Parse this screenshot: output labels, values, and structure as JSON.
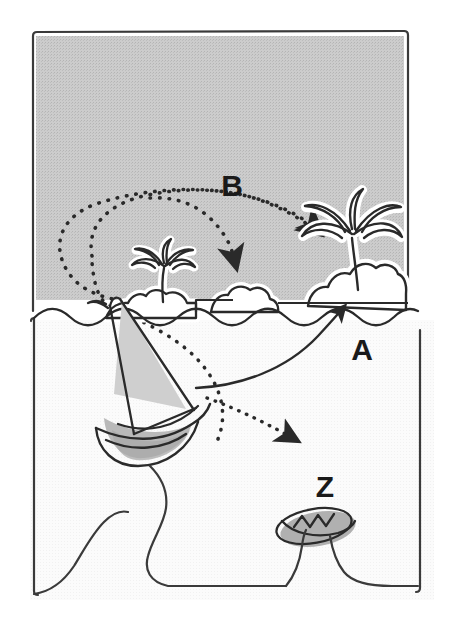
{
  "illustration": {
    "title": "Sailboat route to island diagram",
    "background_color": "#ffffff",
    "sky_color": "#c9c9c9",
    "sea_color": "#fafafa",
    "ink_color": "#2a2a2a",
    "shade_color": "#b0b0b0"
  },
  "labels": [
    {
      "id": "route-b",
      "text": "B",
      "x": 232,
      "y": 196,
      "font_size": 30,
      "description": "Dotted curved route label B"
    },
    {
      "id": "route-a",
      "text": "A",
      "x": 362,
      "y": 360,
      "font_size": 30,
      "description": "Solid curved route label A"
    },
    {
      "id": "object-z",
      "text": "Z",
      "x": 325,
      "y": 497,
      "font_size": 30,
      "description": "Small dinghy label Z"
    }
  ],
  "objects": [
    {
      "id": "sailboat",
      "name": "sailboat",
      "description": "Large sailboat with grey sail and shaded hull"
    },
    {
      "id": "dinghy",
      "name": "rowboat",
      "description": "Small grey rowboat with zigzag seats"
    },
    {
      "id": "island-large",
      "name": "large-island",
      "description": "Large island with big palm tree on the right"
    },
    {
      "id": "island-small",
      "name": "small-island",
      "description": "Small island with palm tree in the middle left"
    },
    {
      "id": "island-rock",
      "name": "rock-island",
      "description": "Small bare rock island between the two palm islands"
    }
  ],
  "routes": [
    {
      "id": "route-a-path",
      "label": "A",
      "style": "solid",
      "from": "sailboat",
      "to": "island-large",
      "arrowhead": true
    },
    {
      "id": "route-b-path",
      "label": "B",
      "style": "dotted",
      "from": "sailboat",
      "to": "island-large",
      "arrowhead": true
    },
    {
      "id": "route-b-branch",
      "label": "B",
      "style": "dotted",
      "from": "sailboat",
      "to": "island-rock",
      "arrowhead": true
    },
    {
      "id": "route-z-path",
      "label": "Z",
      "style": "dotted",
      "from": "sailboat",
      "to": "dinghy",
      "arrowhead": true
    }
  ]
}
